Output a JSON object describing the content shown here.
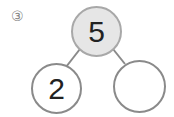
{
  "problem": {
    "number_label": "③",
    "whole": "5",
    "parts": [
      "2",
      ""
    ]
  }
}
